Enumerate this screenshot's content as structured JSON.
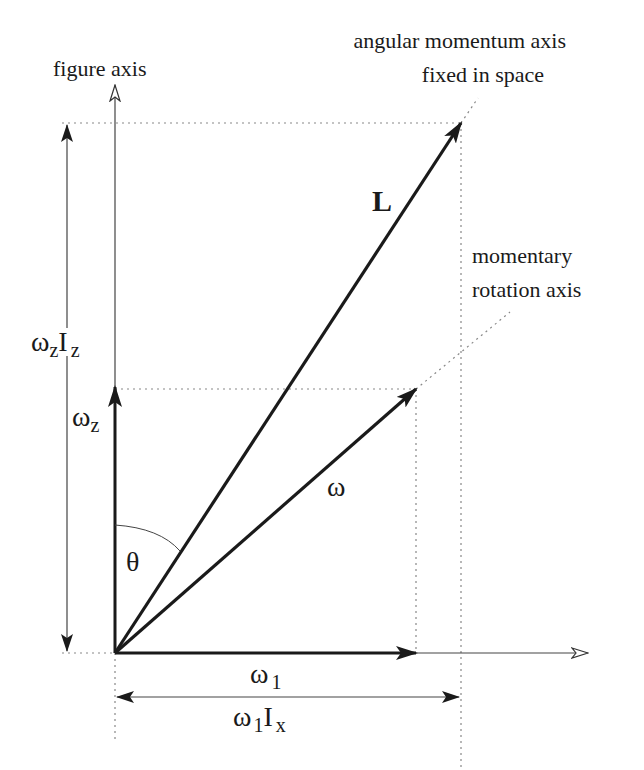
{
  "labels": {
    "figure_axis": "figure axis",
    "angular_momentum_axis_line1": "angular momentum axis",
    "angular_momentum_axis_line2": "fixed in space",
    "momentary_rotation_axis_line1": "momentary",
    "momentary_rotation_axis_line2": "rotation axis",
    "L": "L",
    "omega": "ω",
    "theta": "θ",
    "omega_z_base": "ω",
    "omega_z_sub": "z",
    "omega_z_Iz_base": "ω",
    "omega_z_Iz_sub1": "z",
    "omega_z_Iz_I": "I",
    "omega_z_Iz_sub2": "z",
    "omega_1_base": "ω",
    "omega_1_sub": "1",
    "omega_1_Ix_base": "ω",
    "omega_1_Ix_sub1": "1",
    "omega_1_Ix_I": "I",
    "omega_1_Ix_sub2": "x"
  },
  "geometry": {
    "origin": [
      115,
      653
    ],
    "L_tip": [
      461,
      123
    ],
    "omega_tip": [
      416,
      389
    ],
    "omega_z_tip": [
      115,
      387
    ],
    "figure_axis_tip": [
      115,
      85
    ],
    "x_axis_tip": [
      588,
      653
    ],
    "omega_1_tip": [
      416,
      653
    ]
  },
  "colors": {
    "ink": "#1a1a1a",
    "thin_line": "#555555",
    "dotted": "#888888"
  }
}
